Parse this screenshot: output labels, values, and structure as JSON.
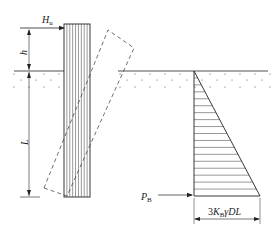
{
  "diagram": {
    "labels": {
      "load": "H",
      "load_sub": "u",
      "height": "h",
      "embedment": "L",
      "resultant": "P",
      "resultant_sub": "B",
      "pressure_max": "3K",
      "pressure_max_sub": "B",
      "pressure_max_tail": "γDL"
    },
    "pressure_hatch_lines": 18,
    "pile_hatch_lines": 8,
    "colors": {
      "line": "#222222",
      "dash": "#333333"
    }
  }
}
